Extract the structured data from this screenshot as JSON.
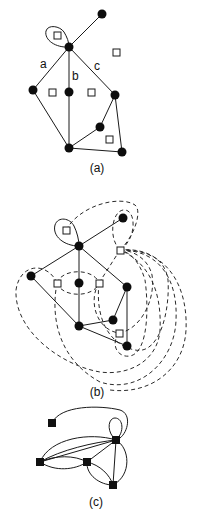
{
  "figure": {
    "panels": [
      {
        "id": "a",
        "caption": "(a)",
        "description": "Plane graph with vertices (filled circles) and face markers (open squares)",
        "edge_labels": [
          "a",
          "b",
          "c"
        ]
      },
      {
        "id": "b",
        "caption": "(b)",
        "description": "Plane graph overlaid with its dual graph (dashed edges connecting face markers)"
      },
      {
        "id": "c",
        "caption": "(c)",
        "description": "Resulting dual graph with square vertices"
      }
    ],
    "colors": {
      "ink": "#111111",
      "background": "#ffffff"
    }
  }
}
